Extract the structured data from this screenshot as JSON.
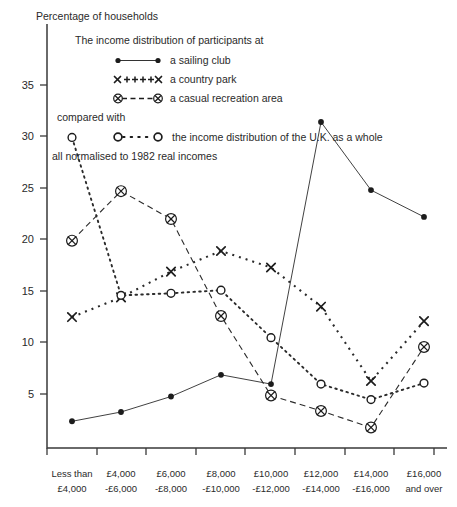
{
  "chart_data": {
    "type": "line",
    "title": "Percentage of households",
    "ylabel": "Percentage of households",
    "xlabel": "",
    "ylim": [
      0,
      38
    ],
    "yticks": [
      5,
      10,
      15,
      20,
      25,
      30,
      35
    ],
    "grid": false,
    "legend_position": "top-inside",
    "annotations": [
      "The income distribution of participants at",
      "compared with",
      "all normalised to 1982 real incomes"
    ],
    "categories": [
      "Less than £4,000",
      "£4,000 -£6,000",
      "£6,000 -£8,000",
      "£8,000 -£10,000",
      "£10,000 -£12,000",
      "£12,000 -£14,000",
      "£14,000 -£16,000",
      "£16,000 and over"
    ],
    "series": [
      {
        "name": "a sailing club",
        "marker": "filled-circle",
        "line": "solid",
        "values": [
          2.3,
          3.2,
          4.7,
          6.8,
          5.9,
          31.3,
          24.7,
          22.1
        ]
      },
      {
        "name": "a country park",
        "marker": "x-cross",
        "line": "dotted-square",
        "values": [
          12.4,
          14.3,
          16.8,
          18.8,
          17.2,
          13.4,
          6.2,
          12.0
        ]
      },
      {
        "name": "a casual recreation area",
        "marker": "circled-cross",
        "line": "dashed",
        "values": [
          19.8,
          24.6,
          21.9,
          12.5,
          4.8,
          3.3,
          1.7,
          9.5
        ]
      },
      {
        "name": "the income distribution of the U.K. as a whole",
        "marker": "open-circle",
        "line": "dotted-round",
        "values": [
          29.8,
          14.5,
          14.7,
          15.0,
          10.4,
          5.9,
          4.4,
          6.0
        ]
      }
    ]
  },
  "xaxis": {
    "tick_labels": [
      {
        "line1": "Less than",
        "line2": "£4,000"
      },
      {
        "line1": "£4,000",
        "line2": "-£6,000"
      },
      {
        "line1": "£6,000",
        "line2": "-£8,000"
      },
      {
        "line1": "£8,000",
        "line2": "-£10,000"
      },
      {
        "line1": "£10,000",
        "line2": "-£12,000"
      },
      {
        "line1": "£12,000",
        "line2": "-£14,000"
      },
      {
        "line1": "£14,000",
        "line2": "-£16,000"
      },
      {
        "line1": "£16,000",
        "line2": "and over"
      }
    ]
  },
  "yaxis": {
    "tick_labels": [
      "35",
      "30",
      "25",
      "20",
      "15",
      "10",
      "5"
    ]
  },
  "legend": {
    "heading": "The income distribution of participants at",
    "compared_with": "compared with",
    "footnote": "all normalised to 1982 real incomes",
    "entries": [
      {
        "label": "a sailing club",
        "marker": "filled-circle",
        "line": "solid"
      },
      {
        "label": "a country park",
        "marker": "x-cross",
        "line": "plus-dotted"
      },
      {
        "label": "a casual recreation area",
        "marker": "circled-cross",
        "line": "dashed"
      },
      {
        "label": "the income distribution of the U.K. as a whole",
        "marker": "open-circle",
        "line": "dotted"
      }
    ]
  },
  "colors": {
    "ink": "#1c1c1c",
    "axis": "#3a3a3a",
    "background": "#ffffff"
  }
}
